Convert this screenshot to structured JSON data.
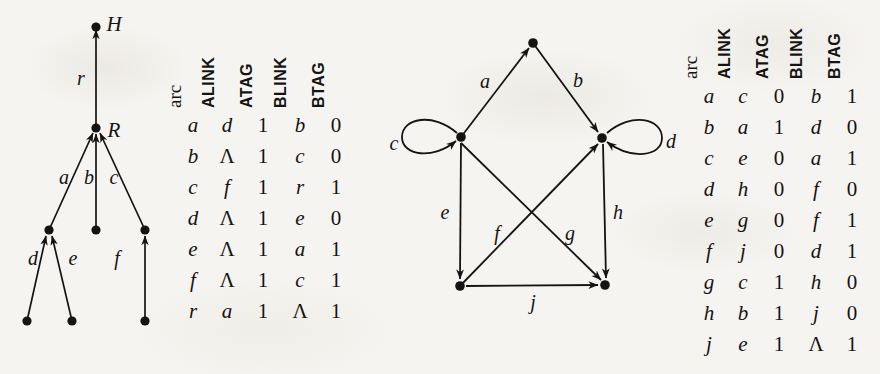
{
  "page": {
    "background_color": "#f6f4f0",
    "ink_color": "#141414",
    "width": 880,
    "height": 374
  },
  "tree_figure": {
    "name": "rooted-tree-diagram",
    "node_labels": [
      {
        "text": "H",
        "x": 114,
        "y": 24
      },
      {
        "text": "R",
        "x": 114,
        "y": 130
      }
    ],
    "arc_labels": [
      {
        "text": "r",
        "x": 81,
        "y": 78
      },
      {
        "text": "a",
        "x": 64,
        "y": 177
      },
      {
        "text": "b",
        "x": 89,
        "y": 177
      },
      {
        "text": "c",
        "x": 114,
        "y": 177
      },
      {
        "text": "d",
        "x": 33,
        "y": 258
      },
      {
        "text": "e",
        "x": 73,
        "y": 258
      },
      {
        "text": "f",
        "x": 117,
        "y": 258
      }
    ],
    "nodes": [
      {
        "id": "H",
        "x": 96,
        "y": 27
      },
      {
        "id": "R",
        "x": 96,
        "y": 128
      },
      {
        "id": "n1",
        "x": 49,
        "y": 230
      },
      {
        "id": "n2",
        "x": 96,
        "y": 230
      },
      {
        "id": "n3",
        "x": 145,
        "y": 230
      },
      {
        "id": "n4",
        "x": 27,
        "y": 321
      },
      {
        "id": "n5",
        "x": 72,
        "y": 321
      },
      {
        "id": "n6",
        "x": 145,
        "y": 321
      }
    ],
    "edges": [
      {
        "label": "r",
        "from": "R",
        "to": "H"
      },
      {
        "label": "a",
        "from": "n1",
        "to": "R"
      },
      {
        "label": "b",
        "from": "n2",
        "to": "R"
      },
      {
        "label": "c",
        "from": "n3",
        "to": "R"
      },
      {
        "label": "d",
        "from": "n4",
        "to": "n1"
      },
      {
        "label": "e",
        "from": "n5",
        "to": "n1"
      },
      {
        "label": "f",
        "from": "n6",
        "to": "n3"
      }
    ]
  },
  "graph_figure": {
    "name": "directed-graph-diagram",
    "arc_labels": [
      {
        "text": "a",
        "x": 485,
        "y": 81
      },
      {
        "text": "b",
        "x": 578,
        "y": 80
      },
      {
        "text": "c",
        "x": 394,
        "y": 143
      },
      {
        "text": "d",
        "x": 671,
        "y": 141
      },
      {
        "text": "e",
        "x": 445,
        "y": 212
      },
      {
        "text": "f",
        "x": 497,
        "y": 233
      },
      {
        "text": "g",
        "x": 570,
        "y": 233
      },
      {
        "text": "h",
        "x": 618,
        "y": 212
      },
      {
        "text": "j",
        "x": 533,
        "y": 302
      }
    ],
    "nodes": [
      {
        "id": "T",
        "x": 533,
        "y": 43
      },
      {
        "id": "L",
        "x": 461,
        "y": 137
      },
      {
        "id": "Rt",
        "x": 602,
        "y": 138
      },
      {
        "id": "BL",
        "x": 460,
        "y": 286
      },
      {
        "id": "BR",
        "x": 605,
        "y": 285
      }
    ],
    "edges": [
      {
        "label": "a",
        "from": "L",
        "to": "T",
        "type": "line"
      },
      {
        "label": "b",
        "from": "T",
        "to": "Rt",
        "type": "line"
      },
      {
        "label": "c",
        "from": "L",
        "to": "L",
        "type": "self-loop-left"
      },
      {
        "label": "d",
        "from": "Rt",
        "to": "Rt",
        "type": "self-loop-right"
      },
      {
        "label": "e",
        "from": "L",
        "to": "BL",
        "type": "line"
      },
      {
        "label": "f",
        "from": "BL",
        "to": "Rt",
        "type": "line"
      },
      {
        "label": "g",
        "from": "L",
        "to": "BR",
        "type": "line"
      },
      {
        "label": "h",
        "from": "Rt",
        "to": "BR",
        "type": "line"
      },
      {
        "label": "j",
        "from": "BL",
        "to": "BR",
        "type": "line"
      }
    ]
  },
  "table_left": {
    "name": "arc-table-tree",
    "headers": [
      "arc",
      "ALINK",
      "ATAG",
      "BLINK",
      "BTAG"
    ],
    "rows": [
      [
        "a",
        "d",
        "1",
        "b",
        "0"
      ],
      [
        "b",
        "Λ",
        "1",
        "c",
        "0"
      ],
      [
        "c",
        "f",
        "1",
        "r",
        "1"
      ],
      [
        "d",
        "Λ",
        "1",
        "e",
        "0"
      ],
      [
        "e",
        "Λ",
        "1",
        "a",
        "1"
      ],
      [
        "f",
        "Λ",
        "1",
        "c",
        "1"
      ],
      [
        "r",
        "a",
        "1",
        "Λ",
        "1"
      ]
    ]
  },
  "table_right": {
    "name": "arc-table-graph",
    "headers": [
      "arc",
      "ALINK",
      "ATAG",
      "BLINK",
      "BTAG"
    ],
    "rows": [
      [
        "a",
        "c",
        "0",
        "b",
        "1"
      ],
      [
        "b",
        "a",
        "1",
        "d",
        "0"
      ],
      [
        "c",
        "e",
        "0",
        "a",
        "1"
      ],
      [
        "d",
        "h",
        "0",
        "f",
        "0"
      ],
      [
        "e",
        "g",
        "0",
        "f",
        "1"
      ],
      [
        "f",
        "j",
        "0",
        "d",
        "1"
      ],
      [
        "g",
        "c",
        "1",
        "h",
        "0"
      ],
      [
        "h",
        "b",
        "1",
        "j",
        "0"
      ],
      [
        "j",
        "e",
        "1",
        "Λ",
        "1"
      ]
    ]
  }
}
